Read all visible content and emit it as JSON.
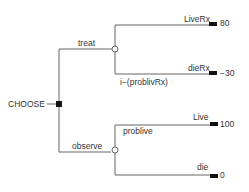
{
  "decision_node": {
    "label": "CHOOSE"
  },
  "branches": [
    {
      "label": "treat",
      "chance": {
        "outcomes": [
          {
            "label": "LiveRx",
            "value": "80"
          },
          {
            "label": "dieRx",
            "value": "−30"
          }
        ],
        "probability_label": "i−(problivRx)"
      }
    },
    {
      "label": "observe",
      "chance": {
        "outcomes": [
          {
            "label": "Live",
            "value": "100"
          },
          {
            "label": "die",
            "value": "0"
          }
        ],
        "probability_label": "problive"
      }
    }
  ],
  "colors": {
    "line": "#666666",
    "node_fill": "#111111",
    "text": "#333333"
  }
}
